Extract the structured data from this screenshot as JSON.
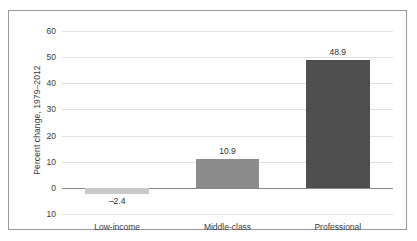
{
  "chart_data": {
    "type": "bar",
    "title": "",
    "subtitle": "",
    "xlabel": "",
    "ylabel": "Percent change, 1979–2012",
    "categories": [
      "Low-income",
      "Middle-class",
      "Professional"
    ],
    "values": [
      -2.4,
      10.9,
      48.9
    ],
    "value_labels": [
      "–2.4",
      "10.9",
      "48.9"
    ],
    "bar_colors": [
      "#c9c9c9",
      "#8c8c8c",
      "#4f4f4f"
    ],
    "ylim": [
      -10,
      60
    ],
    "yticks": [
      60,
      50,
      40,
      30,
      20,
      10,
      0,
      -10
    ],
    "ytick_labels": [
      "60",
      "50",
      "40",
      "30",
      "20",
      "10",
      "0",
      "10"
    ],
    "grid": true,
    "grid_axis": "y",
    "legend": false,
    "legend_position": "none",
    "zero_line": true
  },
  "figure": {
    "border_color": "#9a9a9a",
    "background": "#ffffff",
    "gridline_color": "#e2e2e2",
    "zero_line_color": "#8d8d8d",
    "text_color": "#3a3a3a"
  }
}
